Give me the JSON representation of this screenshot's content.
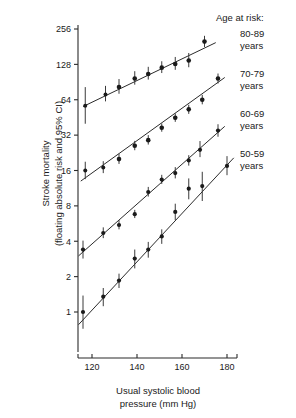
{
  "chart_data": {
    "type": "scatter",
    "title": "",
    "xlabel": "Usual systolic blood pressure (mm Hg)",
    "xlabel_line1": "Usual systolic blood",
    "xlabel_line2": "pressure (mm Hg)",
    "ylabel": "Stroke mortality (floating absolute risk and 95% CI)",
    "ylabel_line1": "Stroke mortality",
    "ylabel_line2": "(floating absolute risk and 95% CI)",
    "yscale": "log2",
    "ylim": [
      0.55,
      300
    ],
    "xlim": [
      110,
      186
    ],
    "grid": false,
    "legend_position": "right",
    "legend_title": "Age at risk:",
    "xticks": [
      120,
      140,
      160,
      180
    ],
    "xtick_labels": [
      "120",
      "140",
      "160",
      "180"
    ],
    "yticks": [
      1,
      2,
      4,
      8,
      16,
      32,
      64,
      128,
      256
    ],
    "ytick_labels": [
      "1",
      "2",
      "4",
      "8",
      "16",
      "32",
      "64",
      "128",
      "256"
    ],
    "series": [
      {
        "name": "80-89 years",
        "label_line1": "80-89",
        "label_line2": "years",
        "x": [
          117,
          126,
          132,
          139,
          145,
          151,
          157,
          163,
          170
        ],
        "values": [
          57,
          71,
          82,
          97,
          106,
          120,
          129,
          138,
          200
        ],
        "ci_low": [
          40,
          62,
          72,
          86,
          95,
          108,
          115,
          121,
          180
        ],
        "ci_high": [
          82,
          84,
          96,
          112,
          122,
          136,
          148,
          160,
          224
        ],
        "fit_x": [
          116,
          175
        ],
        "fit_y": [
          56,
          196
        ]
      },
      {
        "name": "70-79 years",
        "label_line1": "70-79",
        "label_line2": "years",
        "x": [
          117,
          125,
          132,
          139,
          145,
          151,
          157,
          163,
          169,
          176
        ],
        "values": [
          16.0,
          17.0,
          20.0,
          26.0,
          29.0,
          37.0,
          45.0,
          53.0,
          64.0,
          97.0
        ],
        "ci_low": [
          13.5,
          15.2,
          18.2,
          23.8,
          26.6,
          34.2,
          41.5,
          48.5,
          58.5,
          88.0
        ],
        "ci_high": [
          19.0,
          19.2,
          22.2,
          28.6,
          32.0,
          40.2,
          49.0,
          58.0,
          70.5,
          107.0
        ],
        "fit_x": [
          115,
          179
        ],
        "fit_y": [
          13.0,
          99.0
        ]
      },
      {
        "name": "60-69 years",
        "label_line1": "60-69",
        "label_line2": "years",
        "x": [
          116,
          125,
          132,
          139,
          145,
          151,
          157,
          163,
          168,
          176
        ],
        "values": [
          3.4,
          4.7,
          5.5,
          6.8,
          10.5,
          13.4,
          15.2,
          19.5,
          24.0,
          35.0
        ],
        "ci_low": [
          2.85,
          4.25,
          5.05,
          6.3,
          9.6,
          12.3,
          13.7,
          17.6,
          20.8,
          31.0
        ],
        "ci_high": [
          4.05,
          5.25,
          6.05,
          7.4,
          11.6,
          14.7,
          17.1,
          21.6,
          28.5,
          39.6
        ],
        "fit_x": [
          114,
          179
        ],
        "fit_y": [
          3.0,
          38.0
        ]
      },
      {
        "name": "50-59 years",
        "label_line1": "50-59",
        "label_line2": "years",
        "x": [
          116,
          125,
          132,
          139,
          145,
          151,
          157,
          163,
          169,
          180
        ],
        "values": [
          1.0,
          1.35,
          1.85,
          2.85,
          3.4,
          4.4,
          7.1,
          11.2,
          11.8,
          17.5
        ],
        "ci_low": [
          0.72,
          1.12,
          1.6,
          2.35,
          2.9,
          3.8,
          6.05,
          9.1,
          8.8,
          14.6
        ],
        "ci_high": [
          1.38,
          1.6,
          2.12,
          3.4,
          3.95,
          5.05,
          8.35,
          13.7,
          15.6,
          21.2
        ],
        "fit_x": [
          114,
          183
        ],
        "fit_y": [
          0.78,
          20.5
        ]
      }
    ]
  }
}
